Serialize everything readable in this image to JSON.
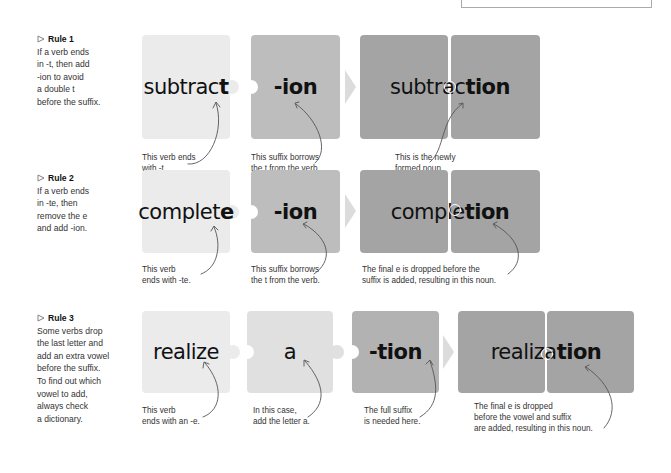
{
  "rules": [
    {
      "heading": "Rule 1",
      "description_lines": [
        "If a verb ends",
        "in -t, then add",
        "-ion to avoid",
        "a double t",
        "before the suffix."
      ],
      "tiles": [
        {
          "regular": "subtrac",
          "bold": "t"
        },
        {
          "regular": "",
          "bold": "-ion"
        }
      ],
      "result": {
        "regular": "subtrac",
        "bold": "tion"
      },
      "captions": [
        [
          "This verb ends",
          "with -t."
        ],
        [
          "This suffix borrows",
          "the t from the verb."
        ],
        [
          "This is the newly",
          "formed noun."
        ]
      ]
    },
    {
      "heading": "Rule 2",
      "description_lines": [
        "If a verb ends",
        "in -te, then",
        "remove the e",
        "and add -ion."
      ],
      "tiles": [
        {
          "regular": "complet",
          "bold": "e"
        },
        {
          "regular": "",
          "bold": "-ion"
        }
      ],
      "result": {
        "regular": "comple",
        "bold": "tion"
      },
      "captions": [
        [
          "This verb",
          "ends with -te."
        ],
        [
          "This suffix borrows",
          "the t from the verb."
        ],
        [
          "The final e is dropped before the",
          "suffix is added, resulting in this noun."
        ]
      ]
    },
    {
      "heading": "Rule 3",
      "description_lines": [
        "Some verbs drop",
        "the last letter and",
        "add an extra vowel",
        "before the suffix.",
        "To find out which",
        "vowel to add,",
        "always check",
        "a dictionary."
      ],
      "tiles": [
        {
          "regular": "realize",
          "bold": ""
        },
        {
          "regular": "a",
          "bold": ""
        },
        {
          "regular": "",
          "bold": "-tion"
        }
      ],
      "result": {
        "regular": "realiza",
        "bold": "tion"
      },
      "captions": [
        [
          "This verb",
          "ends with an -e."
        ],
        [
          "In this case,",
          "add the letter a."
        ],
        [
          "The full suffix",
          "is needed here."
        ],
        [
          "The final e is dropped",
          "before the vowel and suffix",
          "are added, resulting in this noun."
        ]
      ]
    }
  ],
  "colors": {
    "tile_light": "#ebebeb",
    "tile_lighter": "#e0e0e0",
    "tile_mid": "#bdbdbd",
    "tile_mid2": "#b2b2b2",
    "tile_dark": "#a4a4a4",
    "chevron": "#dcdcdc",
    "annotation_line": "#555555"
  }
}
